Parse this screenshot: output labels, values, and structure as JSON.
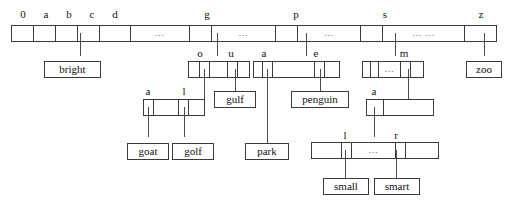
{
  "diagram": {
    "type": "trie",
    "line_color": "#4a4a4a",
    "border_color": "#3a3a3a",
    "background": "#ffffff",
    "ellipsis": "...",
    "ellipsis_double": "... ...",
    "root": {
      "name": "root-node",
      "labels": [
        "0",
        "a",
        "b",
        "c",
        "d",
        "g",
        "p",
        "s",
        "z"
      ],
      "cells": [
        {
          "label": "0",
          "content": ""
        },
        {
          "label": "a",
          "content": ""
        },
        {
          "label": "b",
          "content": ""
        },
        {
          "label": "c",
          "content": ""
        },
        {
          "label": "d",
          "content": ""
        },
        {
          "label": "",
          "content": "..."
        },
        {
          "label": "g",
          "content": ""
        },
        {
          "label": "",
          "content": "..."
        },
        {
          "label": "p",
          "content": ""
        },
        {
          "label": "",
          "content": "..."
        },
        {
          "label": "s",
          "content": ""
        },
        {
          "label": "",
          "content": "... ..."
        },
        {
          "label": "z",
          "content": ""
        }
      ]
    },
    "node_g": {
      "name": "node-g",
      "cells": [
        {
          "label": "",
          "content": ""
        },
        {
          "label": "o",
          "content": ""
        },
        {
          "label": "",
          "content": ""
        },
        {
          "label": "u",
          "content": ""
        },
        {
          "label": "",
          "content": ""
        }
      ]
    },
    "node_p": {
      "name": "node-p",
      "cells": [
        {
          "label": "",
          "content": ""
        },
        {
          "label": "a",
          "content": ""
        },
        {
          "label": "",
          "content": ""
        },
        {
          "label": "e",
          "content": ""
        },
        {
          "label": "",
          "content": ""
        }
      ]
    },
    "node_s": {
      "name": "node-s",
      "cells": [
        {
          "label": "",
          "content": ""
        },
        {
          "label": "",
          "content": ""
        },
        {
          "label": "",
          "content": "..."
        },
        {
          "label": "m",
          "content": ""
        },
        {
          "label": "",
          "content": ""
        }
      ]
    },
    "node_go": {
      "name": "node-go",
      "cells": [
        {
          "label": "a",
          "content": ""
        },
        {
          "label": "",
          "content": ""
        },
        {
          "label": "l",
          "content": ""
        },
        {
          "label": "",
          "content": ""
        }
      ]
    },
    "node_pa": {
      "name": "node-pa",
      "cells": [
        {
          "label": "a",
          "content": ""
        },
        {
          "label": "",
          "content": ""
        }
      ]
    },
    "node_sm": {
      "name": "node-sm",
      "cells": [
        {
          "label": "",
          "content": ""
        },
        {
          "label": "l",
          "content": ""
        },
        {
          "label": "",
          "content": "..."
        },
        {
          "label": "r",
          "content": ""
        },
        {
          "label": "",
          "content": ""
        }
      ]
    },
    "leaves": {
      "bright": "bright",
      "gulf": "gulf",
      "penguin": "penguin",
      "zoo": "zoo",
      "goat": "goat",
      "golf": "golf",
      "park": "park",
      "small": "small",
      "smart": "smart"
    }
  }
}
